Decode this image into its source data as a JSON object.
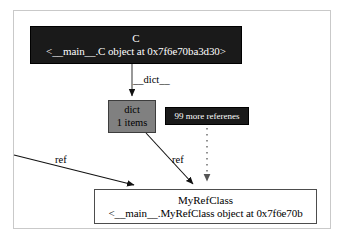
{
  "diagram": {
    "type": "object-reference-graph",
    "background": "#ffffff",
    "frame_color": "#c9c9c9",
    "nodes": [
      {
        "id": "c",
        "name": "c-object-node",
        "title": "C",
        "repr": "<__main__.C object at 0x7f6e70ba3d30>",
        "fill": "#1a1a1a",
        "text_color": "#ffffff"
      },
      {
        "id": "dict",
        "name": "dict-node",
        "title": "dict",
        "sub": "1 items",
        "fill": "#808080",
        "text_color": "#000000"
      },
      {
        "id": "more",
        "name": "more-references-node",
        "label": "99 more referenes",
        "fill": "#1a1a1a",
        "text_color": "#ffffff"
      },
      {
        "id": "myref",
        "name": "myrefclass-node",
        "title": "MyRefClass",
        "repr": "<__main__.MyRefClass object at 0x7f6e70b",
        "fill": "#ffffff",
        "text_color": "#000000"
      }
    ],
    "edges": [
      {
        "id": "c-to-dict",
        "label": "__dict__",
        "style": "solid"
      },
      {
        "id": "dict-to-myref",
        "label": "ref",
        "style": "solid"
      },
      {
        "id": "external-to-myref",
        "label": "ref",
        "style": "solid"
      },
      {
        "id": "more-to-myref",
        "label": "",
        "style": "dotted"
      }
    ]
  }
}
